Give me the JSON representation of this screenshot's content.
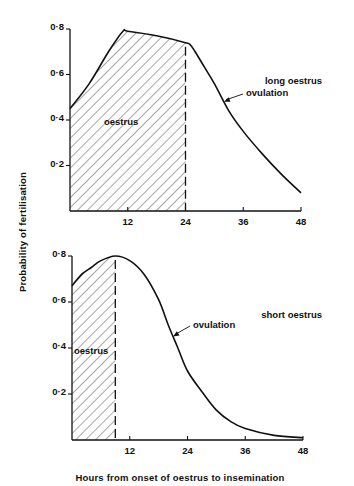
{
  "figure": {
    "ylabel": "Probability of fertilisation",
    "xlabel": "Hours from onset of oestrus to insemination"
  },
  "chart_data": [
    {
      "type": "area",
      "title": "long oestrus",
      "xlabel": "Hours from onset of oestrus to insemination",
      "ylabel": "Probability of fertilisation",
      "xlim": [
        0,
        48
      ],
      "ylim": [
        0,
        0.8
      ],
      "x_ticks": [
        "12",
        "24",
        "36",
        "48"
      ],
      "y_ticks": [
        "0·2",
        "0·4",
        "0·6",
        "0·8"
      ],
      "grid": false,
      "series": [
        {
          "name": "probability of fertilisation",
          "x": [
            0,
            4,
            8,
            11,
            12,
            18,
            24,
            25,
            26,
            28,
            30,
            33,
            36,
            40,
            44,
            48
          ],
          "values": [
            0.45,
            0.56,
            0.7,
            0.79,
            0.79,
            0.77,
            0.74,
            0.73,
            0.7,
            0.63,
            0.56,
            0.44,
            0.35,
            0.25,
            0.16,
            0.08
          ]
        }
      ],
      "shaded_region": {
        "label": "oestrus",
        "x_start": 0,
        "x_end": 24,
        "pattern": "diagonal hatch"
      },
      "annotations": [
        {
          "text": "oestrus",
          "x": 12,
          "y": 0.37
        },
        {
          "text": "ovulation",
          "arrow_to_x": 32,
          "arrow_to_y": 0.43
        },
        {
          "text": "long oestrus"
        }
      ]
    },
    {
      "type": "area",
      "title": "short oestrus",
      "xlabel": "Hours from onset of oestrus to insemination",
      "ylabel": "Probability of fertilisation",
      "xlim": [
        0,
        48
      ],
      "ylim": [
        0,
        0.8
      ],
      "x_ticks": [
        "12",
        "24",
        "36",
        "48"
      ],
      "y_ticks": [
        "0·2",
        "0·4",
        "0·6",
        "0·8"
      ],
      "grid": false,
      "series": [
        {
          "name": "probability of fertilisation",
          "x": [
            0,
            2,
            4,
            6,
            9,
            12,
            15,
            18,
            20,
            22,
            24,
            27,
            30,
            33,
            36,
            42,
            48
          ],
          "values": [
            0.67,
            0.72,
            0.75,
            0.78,
            0.8,
            0.78,
            0.72,
            0.61,
            0.5,
            0.4,
            0.3,
            0.21,
            0.13,
            0.08,
            0.05,
            0.02,
            0.01
          ]
        }
      ],
      "shaded_region": {
        "label": "oestrus",
        "x_start": 0,
        "x_end": 9,
        "pattern": "diagonal hatch"
      },
      "annotations": [
        {
          "text": "oestrus",
          "x": 4.5,
          "y": 0.38
        },
        {
          "text": "ovulation",
          "arrow_to_x": 21,
          "arrow_to_y": 0.43
        },
        {
          "text": "short oestrus"
        }
      ]
    }
  ]
}
